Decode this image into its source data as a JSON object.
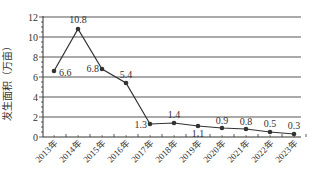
{
  "chart_data": {
    "type": "line",
    "title": "",
    "xlabel": "",
    "ylabel": "发生面积（万亩）",
    "ylim": [
      0,
      12
    ],
    "yticks": [
      0,
      2,
      4,
      6,
      8,
      10,
      12
    ],
    "grid": true,
    "legend": "none",
    "categories": [
      "2013年",
      "2014年",
      "2015年",
      "2016年",
      "2017年",
      "2018年",
      "2019年",
      "2020年",
      "2021年",
      "2022年",
      "2023年"
    ],
    "series": [
      {
        "name": "发生面积",
        "values": [
          6.6,
          10.8,
          6.8,
          5.4,
          1.3,
          1.4,
          1.1,
          0.9,
          0.8,
          0.5,
          0.3
        ],
        "labels": [
          "6.6",
          "10.8",
          "6.8",
          "5.4",
          "1.3",
          "1.4",
          "1.1",
          "0.9",
          "0.8",
          "0.5",
          "0.3"
        ]
      }
    ],
    "colors": {
      "line": "#333333",
      "grid": "#555555",
      "axis": "#333333",
      "text": "#333333"
    }
  }
}
